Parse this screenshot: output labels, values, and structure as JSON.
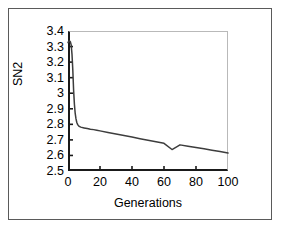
{
  "chart_data": {
    "type": "line",
    "title": "",
    "xlabel": "Generations",
    "ylabel": "SN2",
    "xlim": [
      0,
      100
    ],
    "ylim": [
      2.5,
      3.4
    ],
    "xticks": [
      0,
      20,
      40,
      60,
      80,
      100
    ],
    "yticks": [
      2.5,
      2.6,
      2.7,
      2.8,
      2.9,
      3,
      3.1,
      3.2,
      3.3,
      3.4
    ],
    "xtick_labels": [
      "0",
      "20",
      "40",
      "60",
      "80",
      "100"
    ],
    "ytick_labels": [
      "2.5",
      "2.6",
      "2.7",
      "2.8",
      "2.9",
      "3",
      "3.1",
      "3.2",
      "3.3",
      "3.4"
    ],
    "grid": false,
    "legend": null,
    "series": [
      {
        "name": "SN2",
        "color": "#3d3d3d",
        "x": [
          0,
          0.5,
          1,
          1.5,
          2,
          2.5,
          3,
          3.5,
          4,
          4.5,
          5,
          5.5,
          6,
          6.5,
          7,
          8,
          9,
          10,
          12,
          14,
          16,
          18,
          20,
          25,
          30,
          35,
          40,
          45,
          50,
          55,
          60,
          65,
          70,
          75,
          80,
          85,
          90,
          95,
          100
        ],
        "y": [
          3.325,
          3.335,
          3.335,
          3.33,
          3.31,
          3.25,
          3.15,
          3.02,
          2.93,
          2.87,
          2.835,
          2.812,
          2.8,
          2.792,
          2.787,
          2.782,
          2.779,
          2.777,
          2.773,
          2.769,
          2.766,
          2.762,
          2.758,
          2.748,
          2.738,
          2.728,
          2.718,
          2.708,
          2.698,
          2.688,
          2.678,
          2.638,
          2.668,
          2.659,
          2.651,
          2.643,
          2.634,
          2.625,
          2.615
        ]
      }
    ]
  },
  "axes": {
    "y_label": "SN2",
    "x_label": "Generations"
  },
  "caption_fragment": ""
}
